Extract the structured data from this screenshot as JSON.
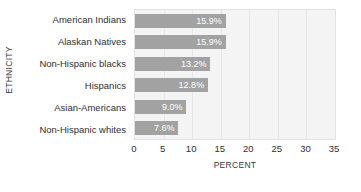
{
  "chart_data": {
    "type": "bar",
    "orientation": "horizontal",
    "title": "",
    "xlabel": "PERCENT",
    "ylabel": "ETHNICITY",
    "categories": [
      "American Indians",
      "Alaskan Natives",
      "Non-Hispanic blacks",
      "Hispanics",
      "Asian-Americans",
      "Non-Hispanic whites"
    ],
    "values": [
      15.9,
      15.9,
      13.2,
      12.8,
      9.0,
      7.6
    ],
    "value_labels": [
      "15.9%",
      "15.9%",
      "13.2%",
      "12.8%",
      "9.0%",
      "7.6%"
    ],
    "xlim": [
      0,
      35
    ],
    "xticks": [
      0,
      5,
      10,
      15,
      20,
      25,
      30,
      35
    ],
    "xtick_labels": [
      "0",
      "5",
      "10",
      "15",
      "20",
      "25",
      "30",
      "35"
    ],
    "grid": "vertical",
    "legend": "none",
    "colors": {
      "bar": "#a2a2a2",
      "bar_label_text": "#ffffff",
      "plot_background": "#f4f4f4",
      "gridline": "#e6e6e6",
      "axis_text": "#2f2f2f",
      "page_background": "#ffffff"
    }
  }
}
